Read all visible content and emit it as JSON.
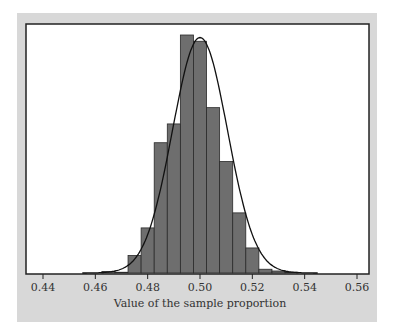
{
  "chart_data": {
    "type": "bar",
    "title": "",
    "xlabel": "Value of the sample proportion",
    "ylabel": "",
    "xlim": [
      0.435,
      0.5665
    ],
    "xticks": [
      "0.44",
      "0.46",
      "0.48",
      "0.50",
      "0.52",
      "0.54",
      "0.56"
    ],
    "tick_values": [
      0.44,
      0.46,
      0.48,
      0.5,
      0.52,
      0.54,
      0.56
    ],
    "bin_width": 0.005,
    "bins": [
      {
        "start": 0.4625,
        "end": 0.4675,
        "height": 0.6
      },
      {
        "start": 0.4675,
        "end": 0.4725,
        "height": 0.3
      },
      {
        "start": 0.4725,
        "end": 0.4775,
        "height": 7.0
      },
      {
        "start": 0.4775,
        "end": 0.4825,
        "height": 18.0
      },
      {
        "start": 0.4825,
        "end": 0.4875,
        "height": 52.0
      },
      {
        "start": 0.4875,
        "end": 0.4925,
        "height": 59.5
      },
      {
        "start": 0.4925,
        "end": 0.4975,
        "height": 95.0
      },
      {
        "start": 0.4975,
        "end": 0.5025,
        "height": 92.5
      },
      {
        "start": 0.5025,
        "end": 0.5075,
        "height": 66.0
      },
      {
        "start": 0.5075,
        "end": 0.5125,
        "height": 44.5
      },
      {
        "start": 0.5125,
        "end": 0.5175,
        "height": 24.0
      },
      {
        "start": 0.5175,
        "end": 0.5225,
        "height": 10.0
      },
      {
        "start": 0.5225,
        "end": 0.5275,
        "height": 1.5
      },
      {
        "start": 0.5275,
        "end": 0.5325,
        "height": 0.8
      },
      {
        "start": 0.5325,
        "end": 0.5375,
        "height": 0.3
      }
    ],
    "curve": {
      "type": "normal",
      "mean": 0.5,
      "sd": 0.0105,
      "peak_height": 94
    },
    "ymax": 100,
    "grid": false,
    "legend": null
  }
}
